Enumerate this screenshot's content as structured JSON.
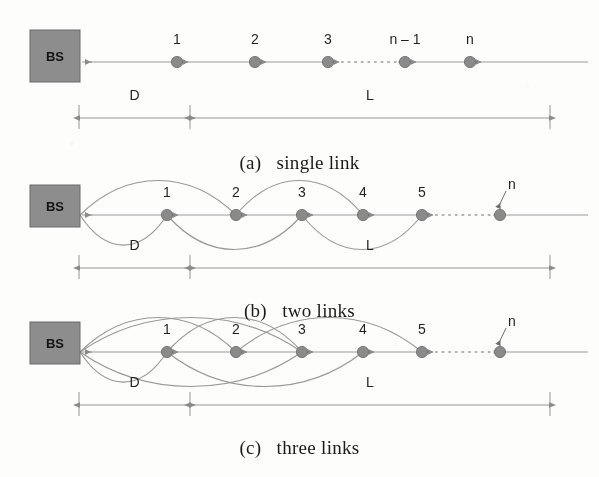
{
  "figure": {
    "bs_label": "BS",
    "dim_labels": {
      "d": "D",
      "l": "L"
    },
    "panels": [
      {
        "id": "a",
        "caption_index": "(a)",
        "caption_text": "single link",
        "caption_full": "(a)   single link",
        "node_labels": [
          "1",
          "2",
          "3",
          "n – 1",
          "n"
        ],
        "node_x": [
          177,
          255,
          328,
          405,
          470
        ],
        "axis_y": 62,
        "bs_box": {
          "x": 30,
          "y": 30,
          "w": 50,
          "h": 52
        },
        "dotted_gap": {
          "from": 335,
          "to": 398
        },
        "dim_line": {
          "y": 118,
          "left": 79,
          "div": 190,
          "right": 550
        },
        "arcs_above": [],
        "arcs_below": []
      },
      {
        "id": "b",
        "caption_index": "(b)",
        "caption_text": "two links",
        "caption_full": "(b)   two links",
        "node_labels": [
          "1",
          "2",
          "3",
          "4",
          "5",
          "n"
        ],
        "node_x": [
          167,
          236,
          302,
          363,
          422,
          500
        ],
        "axis_y": 215,
        "bs_box": {
          "x": 30,
          "y": 185,
          "w": 50,
          "h": 42
        },
        "dotted_gap": {
          "from": 429,
          "to": 493
        },
        "dim_line": {
          "y": 268,
          "left": 79,
          "div": 190,
          "right": 550
        },
        "arcs_above": [
          [
            80,
            236
          ],
          [
            236,
            363
          ]
        ],
        "arcs_below": [
          [
            80,
            167
          ],
          [
            167,
            302
          ],
          [
            302,
            422
          ]
        ]
      },
      {
        "id": "c",
        "caption_index": "(c)",
        "caption_text": "three links",
        "caption_full": "(c)   three links",
        "node_labels": [
          "1",
          "2",
          "3",
          "4",
          "5",
          "n"
        ],
        "node_x": [
          167,
          236,
          302,
          363,
          422,
          500
        ],
        "axis_y": 352,
        "bs_box": {
          "x": 30,
          "y": 322,
          "w": 50,
          "h": 42
        },
        "dotted_gap": {
          "from": 429,
          "to": 493
        },
        "dim_line": {
          "y": 405,
          "left": 79,
          "div": 190,
          "right": 550
        },
        "arcs_above": [
          [
            80,
            236
          ],
          [
            167,
            302
          ],
          [
            236,
            422
          ],
          [
            80,
            302
          ]
        ],
        "arcs_below": [
          [
            80,
            167
          ],
          [
            167,
            363
          ],
          [
            80,
            302
          ]
        ]
      }
    ],
    "colors": {
      "node_fill": "#8a8a8a",
      "node_stroke": "#6f6f6f",
      "bs_fill": "#8d8d8d",
      "bs_stroke": "#6a6a6a",
      "line": "#9a9a9a",
      "arc": "#8f8f8f",
      "text": "#1f1f1f",
      "dim": "#8a8a8a",
      "background": "#fdfdfc"
    },
    "n_leader": {
      "label": "n",
      "panels": [
        "b",
        "c"
      ]
    }
  }
}
